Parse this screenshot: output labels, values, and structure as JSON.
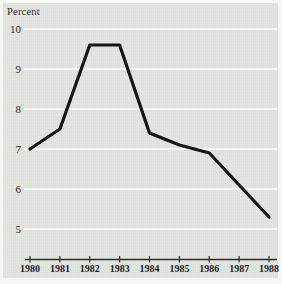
{
  "figure": {
    "axis_unit_label": "Percent"
  },
  "chart_data": {
    "type": "line",
    "title": "",
    "ylabel": "Percent",
    "xlabel": "",
    "categories": [
      "1980",
      "1981",
      "1982",
      "1983",
      "1984",
      "1985",
      "1986",
      "1987",
      "1988"
    ],
    "values": [
      7.0,
      7.5,
      9.6,
      9.6,
      7.4,
      7.1,
      6.9,
      6.1,
      5.3
    ],
    "ylim": [
      5,
      10
    ],
    "y_ticks": [
      10,
      9,
      8,
      7,
      6,
      5
    ],
    "grid": "horizontal",
    "legend": "none",
    "colors": {
      "panel_background": "#e2e4e0",
      "page_margin": "#f7f7f4",
      "gridline": "#fbfbf8",
      "line": "#161616",
      "axis": "#2c2c2c",
      "text": "#2e2e2e"
    }
  }
}
